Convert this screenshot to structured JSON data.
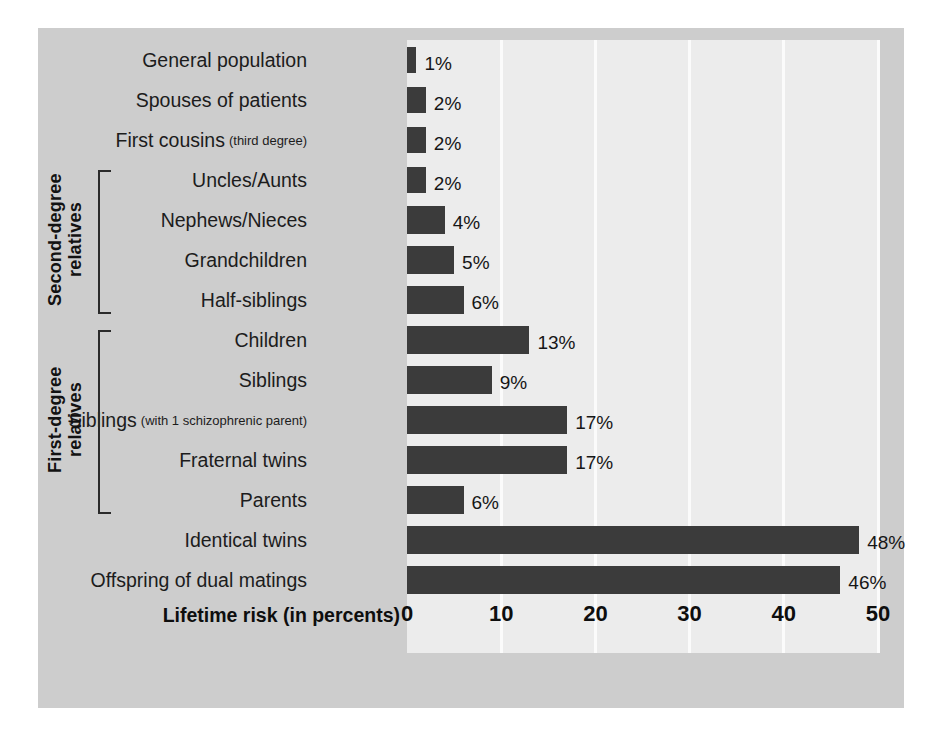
{
  "chart_data": {
    "type": "bar",
    "orientation": "horizontal",
    "title": "",
    "xlabel": "Lifetime risk (in percents)",
    "ylabel": "",
    "xlim": [
      0,
      50
    ],
    "xticks": [
      0,
      10,
      20,
      30,
      40,
      50
    ],
    "xtick_labels": [
      "0",
      "10",
      "20",
      "30",
      "40",
      "50"
    ],
    "grid": true,
    "grid_axis": "x",
    "legend": false,
    "value_suffix": "%",
    "categories": [
      "General population",
      "Spouses of patients",
      "First cousins",
      "Uncles/Aunts",
      "Nephews/Nieces",
      "Grandchildren",
      "Half-siblings",
      "Children",
      "Siblings",
      "Siblings",
      "Fraternal twins",
      "Parents",
      "Identical twins",
      "Offspring of dual matings"
    ],
    "category_subnotes": [
      "",
      "",
      "(third degree)",
      "",
      "",
      "",
      "",
      "",
      "",
      "(with 1 schizophrenic parent)",
      "",
      "",
      "",
      ""
    ],
    "values": [
      1,
      2,
      2,
      2,
      4,
      5,
      6,
      13,
      9,
      17,
      17,
      6,
      48,
      46
    ],
    "value_labels": [
      "1%",
      "2%",
      "2%",
      "2%",
      "4%",
      "5%",
      "6%",
      "13%",
      "9%",
      "17%",
      "17%",
      "6%",
      "48%",
      "46%"
    ],
    "groups": [
      {
        "label": "Second-degree\nrelatives",
        "label_line1": "Second-degree",
        "label_line2": "relatives",
        "first_index": 3,
        "last_index": 6
      },
      {
        "label": "First-degree\nrelatives",
        "label_line1": "First-degree",
        "label_line2": "relatives",
        "first_index": 7,
        "last_index": 11
      }
    ]
  },
  "colors": {
    "bar": "#3b3b3b",
    "plot_background": "#ececec",
    "panel_background": "#cdcdcd",
    "gridline": "#fbfbfb",
    "text": "#1c1c1c",
    "figure_background": "#ffffff"
  }
}
